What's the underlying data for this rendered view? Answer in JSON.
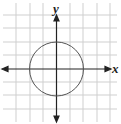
{
  "diagram": {
    "type": "coordinate-plane",
    "x_axis_label": "x",
    "y_axis_label": "y",
    "grid": {
      "cells_x": 9,
      "cells_y": 9,
      "spacing_px": 13.3,
      "color": "#c8c8c8"
    },
    "axis_color": "#222222",
    "shape": {
      "type": "circle",
      "center": [
        0,
        0
      ],
      "radius": 2,
      "color": "#555555"
    }
  }
}
